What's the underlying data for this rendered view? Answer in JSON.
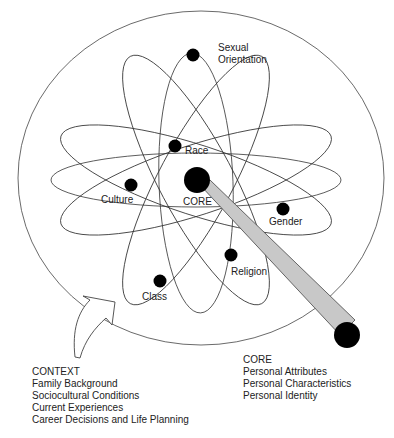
{
  "diagram": {
    "type": "atom-model",
    "center_label": "CORE",
    "orbit_nodes": [
      {
        "label": "Sexual Orientation",
        "line1": "Sexual",
        "line2": "Orientation"
      },
      {
        "label": "Race"
      },
      {
        "label": "Culture"
      },
      {
        "label": "Gender"
      },
      {
        "label": "Religion"
      },
      {
        "label": "Class"
      }
    ],
    "context": {
      "title": "CONTEXT",
      "items": [
        "Family Background",
        "Sociocultural Conditions",
        "Current Experiences",
        "Career Decisions and Life Planning"
      ]
    },
    "core": {
      "title": "CORE",
      "items": [
        "Personal Attributes",
        "Personal Characteristics",
        "Personal Identity"
      ]
    },
    "colors": {
      "stroke": "#333333",
      "node": "#000000",
      "beam": "#c8c8c8"
    }
  }
}
